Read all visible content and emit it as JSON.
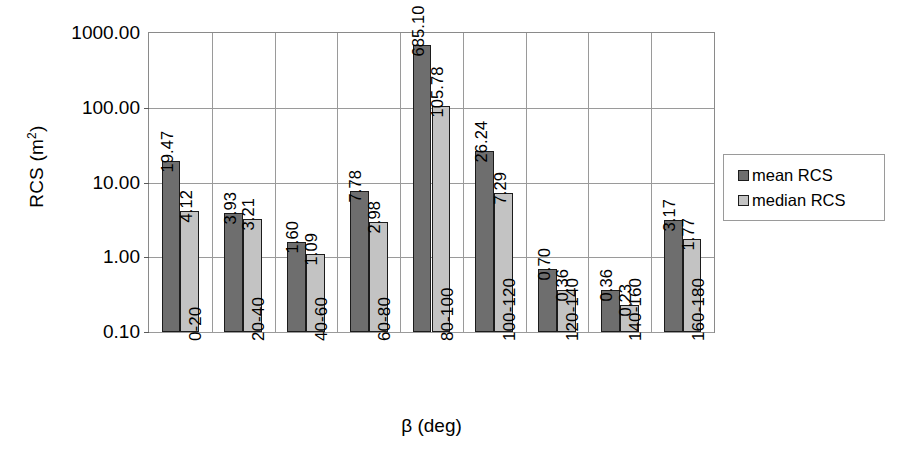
{
  "chart_data": {
    "type": "bar",
    "title": "",
    "xlabel": "β (deg)",
    "ylabel": "RCS (m²)",
    "yscale": "log",
    "ylim": [
      0.1,
      1000.0
    ],
    "ytick_labels": [
      "1000.00",
      "100.00",
      "10.00",
      "1.00",
      "0.10"
    ],
    "ytick_values": [
      1000,
      100,
      10,
      1,
      0.1
    ],
    "grid": true,
    "legend_position": "right",
    "categories": [
      "0-20",
      "20-40",
      "40-60",
      "60-80",
      "80-100",
      "100-120",
      "120-140",
      "140-160",
      "160-180"
    ],
    "series": [
      {
        "name": "mean RCS",
        "color": "#6e6e6e",
        "values": [
          19.47,
          3.93,
          1.6,
          7.78,
          685.1,
          26.24,
          0.7,
          0.36,
          3.17
        ],
        "labels": [
          "19.47",
          "3.93",
          "1.60",
          "7.78",
          "685.10",
          "26.24",
          "0.70",
          "0.36",
          "3.17"
        ]
      },
      {
        "name": "median RCS",
        "color": "#c3c3c3",
        "values": [
          4.12,
          3.21,
          1.09,
          2.98,
          105.78,
          7.29,
          0.36,
          0.23,
          1.77
        ],
        "labels": [
          "4.12",
          "3.21",
          "1.09",
          "2.98",
          "105.78",
          "7.29",
          "0.36",
          "0.23",
          "1.77"
        ]
      }
    ]
  },
  "legend": {
    "entries": [
      {
        "label": "mean RCS"
      },
      {
        "label": "median RCS"
      }
    ]
  }
}
